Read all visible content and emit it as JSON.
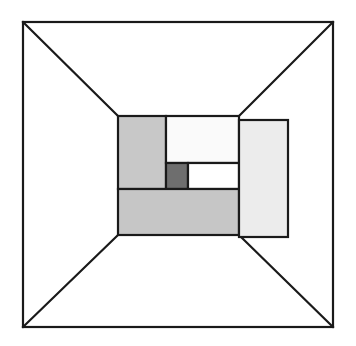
{
  "figure": {
    "title": "Perspective box with inset rectangular subdivision",
    "canvas": {
      "width": 356,
      "height": 346,
      "background": "#ffffff"
    },
    "stroke": {
      "color": "#1a1a1a",
      "width": 2.2
    },
    "outer_frame": {
      "name": "outer-frame",
      "left": 23,
      "top": 22,
      "right": 333,
      "bottom": 327,
      "fill": "#ffffff",
      "stroke": "#1a1a1a",
      "stroke_width": 2.2
    },
    "inner_frame": {
      "name": "inner-frame",
      "left": 118,
      "top": 116,
      "right": 288,
      "bottom": 237
    },
    "perspective_lines": [
      {
        "name": "perspective-line-top-left",
        "x1": 23,
        "y1": 22,
        "x2": 118,
        "y2": 116
      },
      {
        "name": "perspective-line-top-right",
        "x1": 333,
        "y1": 22,
        "x2": 239,
        "y2": 116
      },
      {
        "name": "perspective-line-bottom-left",
        "x1": 23,
        "y1": 327,
        "x2": 118,
        "y2": 235
      },
      {
        "name": "perspective-line-bottom-right",
        "x1": 333,
        "y1": 327,
        "x2": 239,
        "y2": 235
      }
    ],
    "blocks": [
      {
        "name": "block-left-gray",
        "label": "Left medium-gray panel",
        "x": 118,
        "y": 116,
        "width": 48,
        "height": 73,
        "fill": "#c8c8c8"
      },
      {
        "name": "block-top-white",
        "label": "Top white panel",
        "x": 166,
        "y": 116,
        "width": 73,
        "height": 47,
        "fill": "#fafafa"
      },
      {
        "name": "block-dark-square",
        "label": "Dark gray square",
        "x": 166,
        "y": 163,
        "width": 22,
        "height": 26,
        "fill": "#6e6e6e"
      },
      {
        "name": "block-mid-white",
        "label": "Middle white panel",
        "x": 188,
        "y": 163,
        "width": 51,
        "height": 26,
        "fill": "#ffffff"
      },
      {
        "name": "block-bottom-gray",
        "label": "Bottom medium-gray panel",
        "x": 118,
        "y": 189,
        "width": 121,
        "height": 46,
        "fill": "#c6c6c6"
      },
      {
        "name": "block-right-pale",
        "label": "Right pale panel",
        "x": 239,
        "y": 120,
        "width": 49,
        "height": 117,
        "fill": "#ececec"
      }
    ]
  }
}
